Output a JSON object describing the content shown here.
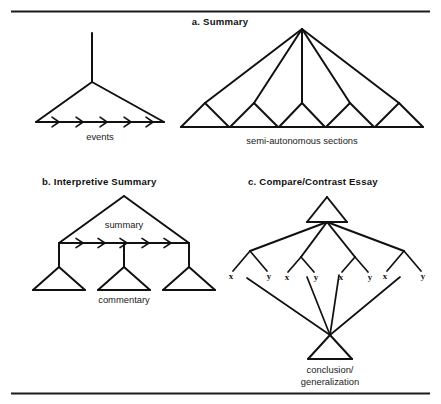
{
  "figure": {
    "title_top_rule": "horizontal-rule",
    "panels": [
      {
        "id": "a",
        "title": "a. Summary",
        "diagrams": [
          {
            "id": "a-left",
            "label": "events"
          },
          {
            "id": "a-right",
            "label": "semi-autonomous sections"
          }
        ]
      },
      {
        "id": "b",
        "title": "b. Interpretive Summary",
        "diagrams": [
          {
            "id": "b-top",
            "label": "summary"
          },
          {
            "id": "b-bottom",
            "label": "commentary"
          }
        ]
      },
      {
        "id": "c",
        "title": "c. Compare/Contrast Essay",
        "diagrams": [
          {
            "id": "c-bottom",
            "label_line1": "conclusion/",
            "label_line2": "generalization"
          }
        ]
      }
    ],
    "leaf_labels": {
      "x": "x",
      "y": "y"
    },
    "counts": {
      "a_left_arrows": 5,
      "a_right_sections": 5,
      "b_arrows": 5,
      "b_commentary_triangles": 3,
      "c_pairs": 4
    },
    "colors": {
      "ink": "#111111",
      "rule": "#1a1a1a",
      "background": "#ffffff"
    }
  }
}
